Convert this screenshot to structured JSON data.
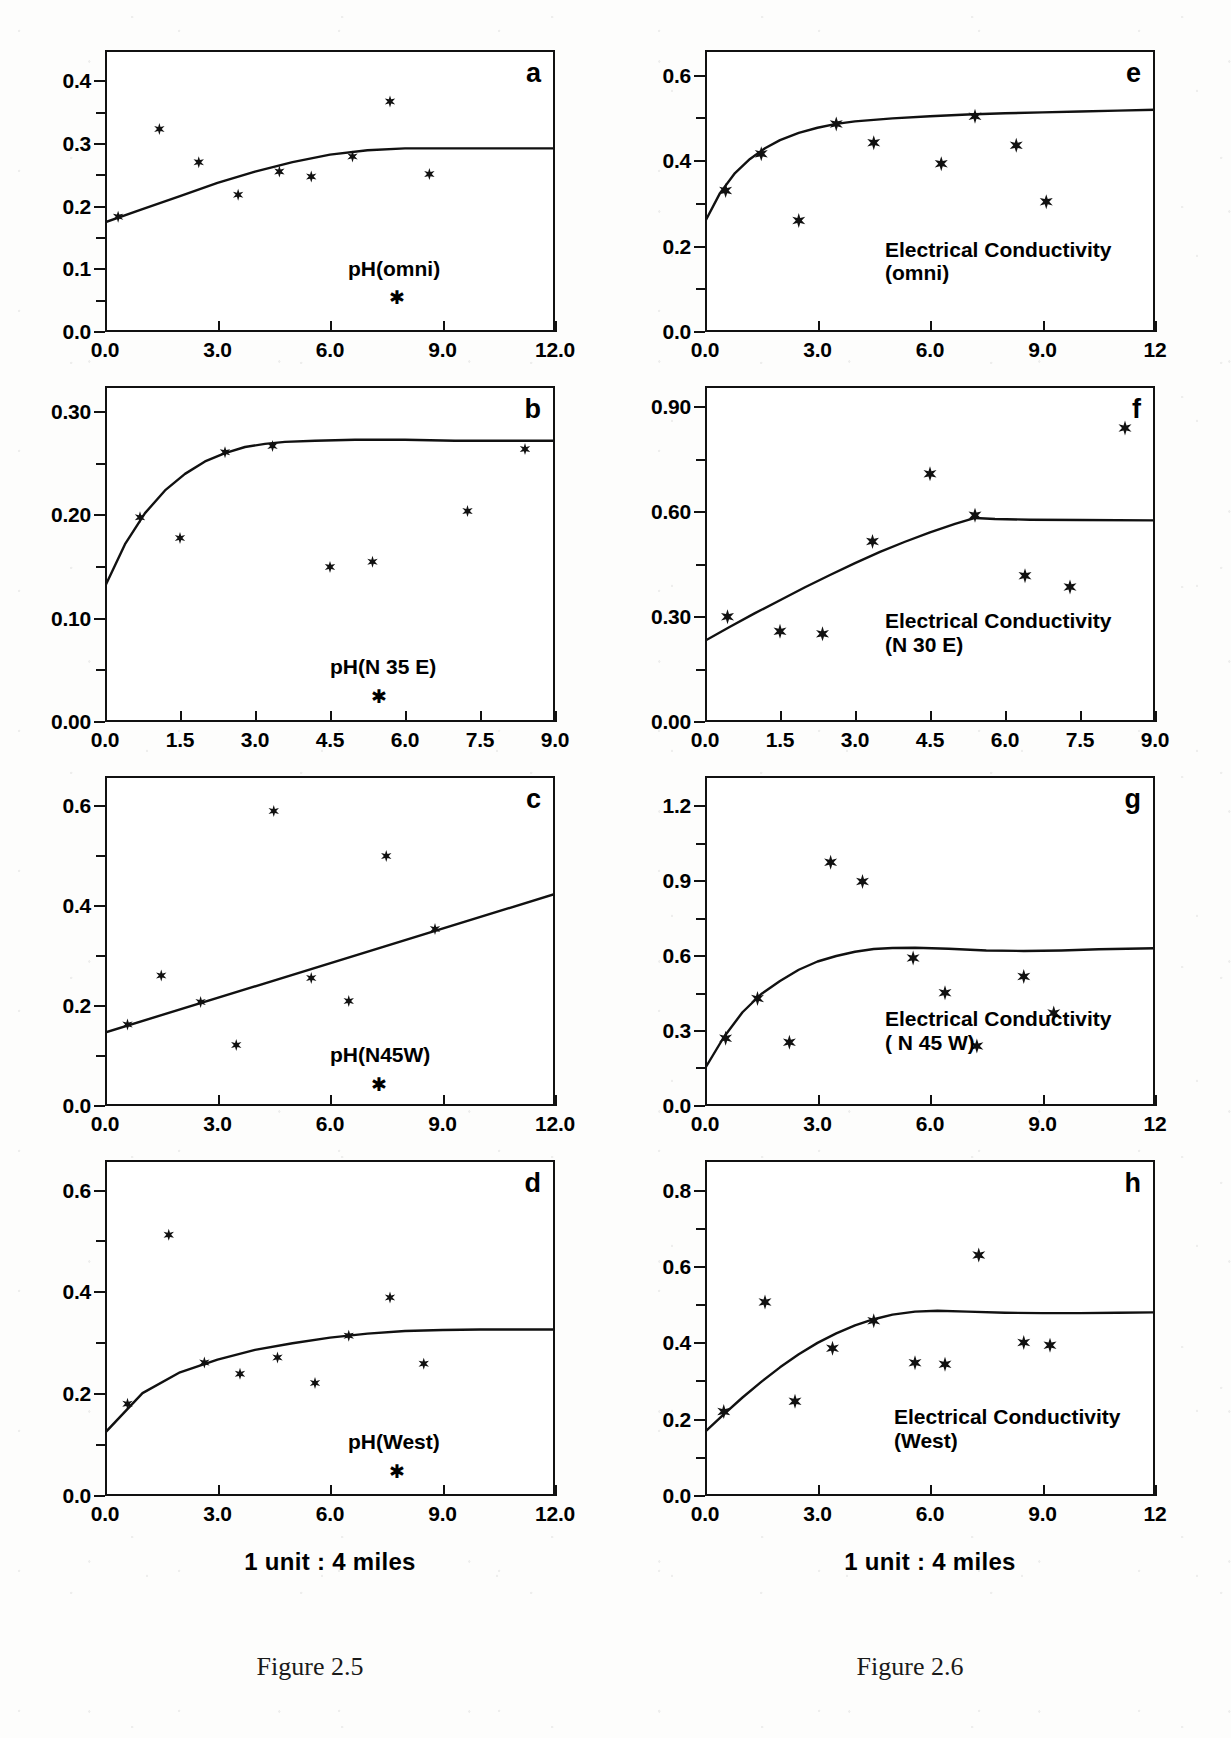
{
  "captions": {
    "left": "Figure 2.5",
    "right": "Figure 2.6"
  },
  "axis_title": "1 unit : 4 miles",
  "chart_data": [
    {
      "type": "scatter",
      "panel": "a",
      "title": "pH(omni)",
      "xlabel": "1 unit : 4 miles",
      "ylabel": "",
      "xlim": [
        0.0,
        12.0
      ],
      "ylim": [
        0.0,
        0.45
      ],
      "xticks": [
        "0.0",
        "3.0",
        "6.0",
        "9.0",
        "12.0"
      ],
      "xtick_values": [
        0.0,
        3.0,
        6.0,
        9.0,
        12.0
      ],
      "yticks": [
        "0.0",
        "0.1",
        "0.2",
        "0.3",
        "0.4"
      ],
      "ytick_values": [
        0.0,
        0.1,
        0.2,
        0.3,
        0.4
      ],
      "grid": false,
      "legend": "none",
      "points": [
        [
          0.35,
          0.184
        ],
        [
          1.45,
          0.324
        ],
        [
          2.5,
          0.271
        ],
        [
          3.55,
          0.219
        ],
        [
          4.65,
          0.256
        ],
        [
          5.5,
          0.248
        ],
        [
          6.6,
          0.28
        ],
        [
          7.6,
          0.368
        ],
        [
          8.65,
          0.252
        ]
      ],
      "model": [
        [
          0.0,
          0.175
        ],
        [
          1.0,
          0.196
        ],
        [
          2.0,
          0.217
        ],
        [
          3.0,
          0.238
        ],
        [
          4.0,
          0.256
        ],
        [
          5.0,
          0.271
        ],
        [
          6.0,
          0.283
        ],
        [
          7.0,
          0.29
        ],
        [
          8.0,
          0.293
        ],
        [
          9.0,
          0.293
        ],
        [
          10.0,
          0.293
        ],
        [
          11.0,
          0.293
        ],
        [
          12.0,
          0.293
        ]
      ]
    },
    {
      "type": "scatter",
      "panel": "b",
      "title": "pH(N 35 E)",
      "xlabel": "1 unit : 4 miles",
      "ylabel": "",
      "xlim": [
        0.0,
        9.0
      ],
      "ylim": [
        0.0,
        0.325
      ],
      "xticks": [
        "0.0",
        "1.5",
        "3.0",
        "4.5",
        "6.0",
        "7.5",
        "9.0"
      ],
      "xtick_values": [
        0.0,
        1.5,
        3.0,
        4.5,
        6.0,
        7.5,
        9.0
      ],
      "yticks": [
        "0.00",
        "0.10",
        "0.20",
        "0.30"
      ],
      "ytick_values": [
        0.0,
        0.1,
        0.2,
        0.3
      ],
      "grid": false,
      "legend": "none",
      "points": [
        [
          0.7,
          0.198
        ],
        [
          1.5,
          0.178
        ],
        [
          2.4,
          0.261
        ],
        [
          3.35,
          0.267
        ],
        [
          4.5,
          0.15
        ],
        [
          5.35,
          0.155
        ],
        [
          7.25,
          0.204
        ],
        [
          8.4,
          0.264
        ]
      ],
      "model": [
        [
          0.0,
          0.131
        ],
        [
          0.4,
          0.172
        ],
        [
          0.8,
          0.202
        ],
        [
          1.2,
          0.224
        ],
        [
          1.6,
          0.24
        ],
        [
          2.0,
          0.252
        ],
        [
          2.4,
          0.26
        ],
        [
          2.8,
          0.266
        ],
        [
          3.2,
          0.269
        ],
        [
          3.6,
          0.271
        ],
        [
          4.2,
          0.272
        ],
        [
          5.0,
          0.273
        ],
        [
          6.0,
          0.273
        ],
        [
          7.0,
          0.272
        ],
        [
          8.0,
          0.272
        ],
        [
          9.0,
          0.272
        ]
      ]
    },
    {
      "type": "scatter",
      "panel": "c",
      "title": "pH(N45W)",
      "xlabel": "1 unit : 4 miles",
      "ylabel": "",
      "xlim": [
        0.0,
        12.0
      ],
      "ylim": [
        0.0,
        0.66
      ],
      "xticks": [
        "0.0",
        "3.0",
        "6.0",
        "9.0",
        "12.0"
      ],
      "xtick_values": [
        0.0,
        3.0,
        6.0,
        9.0,
        12.0
      ],
      "yticks": [
        "0.0",
        "0.2",
        "0.4",
        "0.6"
      ],
      "ytick_values": [
        0.0,
        0.2,
        0.4,
        0.6
      ],
      "grid": false,
      "legend": "none",
      "points": [
        [
          0.6,
          0.163
        ],
        [
          1.5,
          0.261
        ],
        [
          2.55,
          0.208
        ],
        [
          3.5,
          0.122
        ],
        [
          4.5,
          0.59
        ],
        [
          5.5,
          0.256
        ],
        [
          6.5,
          0.21
        ],
        [
          7.5,
          0.5
        ],
        [
          8.8,
          0.354
        ]
      ],
      "model": [
        [
          0.0,
          0.147
        ],
        [
          12.0,
          0.424
        ]
      ]
    },
    {
      "type": "scatter",
      "panel": "d",
      "title": "pH(West)",
      "xlabel": "1 unit : 4 miles",
      "ylabel": "",
      "xlim": [
        0.0,
        12.0
      ],
      "ylim": [
        0.0,
        0.66
      ],
      "xticks": [
        "0.0",
        "3.0",
        "6.0",
        "9.0",
        "12.0"
      ],
      "xtick_values": [
        0.0,
        3.0,
        6.0,
        9.0,
        12.0
      ],
      "yticks": [
        "0.0",
        "0.2",
        "0.4",
        "0.6"
      ],
      "ytick_values": [
        0.0,
        0.2,
        0.4,
        0.6
      ],
      "grid": false,
      "legend": "none",
      "points": [
        [
          0.6,
          0.181
        ],
        [
          1.7,
          0.513
        ],
        [
          2.65,
          0.262
        ],
        [
          3.6,
          0.24
        ],
        [
          4.6,
          0.272
        ],
        [
          5.6,
          0.222
        ],
        [
          6.5,
          0.315
        ],
        [
          7.6,
          0.39
        ],
        [
          8.5,
          0.26
        ]
      ],
      "model": [
        [
          0.0,
          0.124
        ],
        [
          1.0,
          0.202
        ],
        [
          2.0,
          0.243
        ],
        [
          3.0,
          0.268
        ],
        [
          4.0,
          0.287
        ],
        [
          5.0,
          0.3
        ],
        [
          6.0,
          0.311
        ],
        [
          7.0,
          0.319
        ],
        [
          8.0,
          0.324
        ],
        [
          9.0,
          0.326
        ],
        [
          10.0,
          0.327
        ],
        [
          11.0,
          0.327
        ],
        [
          12.0,
          0.327
        ]
      ]
    },
    {
      "type": "scatter",
      "panel": "e",
      "title": "Electrical Conductivity\n(omni)",
      "xlabel": "1 unit : 4 miles",
      "ylabel": "",
      "xlim": [
        0.0,
        12.0
      ],
      "ylim": [
        0.0,
        0.66
      ],
      "xticks": [
        "0.0",
        "3.0",
        "6.0",
        "9.0",
        "12"
      ],
      "xtick_values": [
        0.0,
        3.0,
        6.0,
        9.0,
        12.0
      ],
      "yticks": [
        "0.0",
        "0.2",
        "0.4",
        "0.6"
      ],
      "ytick_values": [
        0.0,
        0.2,
        0.4,
        0.6
      ],
      "grid": false,
      "legend": "none",
      "points": [
        [
          0.55,
          0.331
        ],
        [
          1.5,
          0.417
        ],
        [
          2.5,
          0.261
        ],
        [
          3.5,
          0.487
        ],
        [
          4.5,
          0.443
        ],
        [
          6.3,
          0.394
        ],
        [
          7.2,
          0.505
        ],
        [
          8.3,
          0.437
        ],
        [
          9.1,
          0.305
        ]
      ],
      "model": [
        [
          0.0,
          0.258
        ],
        [
          0.4,
          0.325
        ],
        [
          0.8,
          0.372
        ],
        [
          1.2,
          0.405
        ],
        [
          1.6,
          0.43
        ],
        [
          2.0,
          0.449
        ],
        [
          2.5,
          0.466
        ],
        [
          3.0,
          0.478
        ],
        [
          3.5,
          0.487
        ],
        [
          4.0,
          0.493
        ],
        [
          5.0,
          0.5
        ],
        [
          6.0,
          0.505
        ],
        [
          7.0,
          0.509
        ],
        [
          8.0,
          0.512
        ],
        [
          9.0,
          0.514
        ],
        [
          10.0,
          0.516
        ],
        [
          11.0,
          0.518
        ],
        [
          12.0,
          0.52
        ]
      ]
    },
    {
      "type": "scatter",
      "panel": "f",
      "title": "Electrical Conductivity\n(N 30 E)",
      "xlabel": "1 unit : 4 miles",
      "ylabel": "",
      "xlim": [
        0.0,
        9.0
      ],
      "ylim": [
        0.0,
        0.96
      ],
      "xticks": [
        "0.0",
        "1.5",
        "3.0",
        "4.5",
        "6.0",
        "7.5",
        "9.0"
      ],
      "xtick_values": [
        0.0,
        1.5,
        3.0,
        4.5,
        6.0,
        7.5,
        9.0
      ],
      "yticks": [
        "0.00",
        "0.30",
        "0.60",
        "0.90"
      ],
      "ytick_values": [
        0.0,
        0.3,
        0.6,
        0.9
      ],
      "grid": false,
      "legend": "none",
      "points": [
        [
          0.45,
          0.301
        ],
        [
          1.5,
          0.259
        ],
        [
          2.35,
          0.252
        ],
        [
          3.35,
          0.516
        ],
        [
          4.5,
          0.709
        ],
        [
          5.4,
          0.591
        ],
        [
          6.4,
          0.418
        ],
        [
          7.3,
          0.386
        ],
        [
          8.4,
          0.84
        ]
      ],
      "model": [
        [
          0.0,
          0.232
        ],
        [
          0.5,
          0.272
        ],
        [
          1.0,
          0.311
        ],
        [
          1.5,
          0.348
        ],
        [
          2.0,
          0.385
        ],
        [
          2.5,
          0.42
        ],
        [
          3.0,
          0.454
        ],
        [
          3.5,
          0.486
        ],
        [
          4.0,
          0.515
        ],
        [
          4.5,
          0.542
        ],
        [
          5.0,
          0.566
        ],
        [
          5.4,
          0.583
        ],
        [
          5.8,
          0.58
        ],
        [
          6.5,
          0.578
        ],
        [
          7.5,
          0.577
        ],
        [
          9.0,
          0.576
        ]
      ]
    },
    {
      "type": "scatter",
      "panel": "g",
      "title": "Electrical Conductivity\n( N 45 W)",
      "xlabel": "1 unit : 4 miles",
      "ylabel": "",
      "xlim": [
        0.0,
        12.0
      ],
      "ylim": [
        0.0,
        1.32
      ],
      "xticks": [
        "0.0",
        "3.0",
        "6.0",
        "9.0",
        "12"
      ],
      "xtick_values": [
        0.0,
        3.0,
        6.0,
        9.0,
        12.0
      ],
      "yticks": [
        "0.0",
        "0.3",
        "0.6",
        "0.9",
        "1.2"
      ],
      "ytick_values": [
        0.0,
        0.3,
        0.6,
        0.9,
        1.2
      ],
      "grid": false,
      "legend": "none",
      "points": [
        [
          0.55,
          0.271
        ],
        [
          1.4,
          0.43
        ],
        [
          2.25,
          0.255
        ],
        [
          3.35,
          0.975
        ],
        [
          4.2,
          0.898
        ],
        [
          5.55,
          0.592
        ],
        [
          6.4,
          0.453
        ],
        [
          7.25,
          0.24
        ],
        [
          8.5,
          0.518
        ],
        [
          9.3,
          0.372
        ]
      ],
      "model": [
        [
          0.0,
          0.15
        ],
        [
          0.5,
          0.275
        ],
        [
          1.0,
          0.375
        ],
        [
          1.5,
          0.448
        ],
        [
          2.0,
          0.5
        ],
        [
          2.5,
          0.545
        ],
        [
          3.0,
          0.578
        ],
        [
          3.5,
          0.6
        ],
        [
          4.0,
          0.617
        ],
        [
          4.5,
          0.628
        ],
        [
          5.0,
          0.632
        ],
        [
          5.6,
          0.633
        ],
        [
          6.5,
          0.629
        ],
        [
          7.5,
          0.622
        ],
        [
          8.5,
          0.62
        ],
        [
          9.5,
          0.622
        ],
        [
          10.5,
          0.627
        ],
        [
          12.0,
          0.631
        ]
      ]
    },
    {
      "type": "scatter",
      "panel": "h",
      "title": "Electrical Conductivity\n(West)",
      "xlabel": "1 unit : 4 miles",
      "ylabel": "",
      "xlim": [
        0.0,
        12.0
      ],
      "ylim": [
        0.0,
        0.88
      ],
      "xticks": [
        "0.0",
        "3.0",
        "6.0",
        "9.0",
        "12"
      ],
      "xtick_values": [
        0.0,
        3.0,
        6.0,
        9.0,
        12.0
      ],
      "yticks": [
        "0.0",
        "0.2",
        "0.4",
        "0.6",
        "0.8"
      ],
      "ytick_values": [
        0.0,
        0.2,
        0.4,
        0.6,
        0.8
      ],
      "grid": false,
      "legend": "none",
      "points": [
        [
          0.5,
          0.221
        ],
        [
          1.6,
          0.508
        ],
        [
          2.4,
          0.248
        ],
        [
          3.4,
          0.387
        ],
        [
          4.5,
          0.459
        ],
        [
          5.6,
          0.349
        ],
        [
          6.4,
          0.345
        ],
        [
          7.3,
          0.631
        ],
        [
          8.5,
          0.402
        ],
        [
          9.2,
          0.395
        ]
      ],
      "model": [
        [
          0.0,
          0.168
        ],
        [
          0.5,
          0.214
        ],
        [
          1.0,
          0.258
        ],
        [
          1.5,
          0.299
        ],
        [
          2.0,
          0.337
        ],
        [
          2.5,
          0.371
        ],
        [
          3.0,
          0.401
        ],
        [
          3.5,
          0.426
        ],
        [
          4.0,
          0.447
        ],
        [
          4.5,
          0.463
        ],
        [
          5.0,
          0.475
        ],
        [
          5.6,
          0.483
        ],
        [
          6.2,
          0.485
        ],
        [
          7.0,
          0.483
        ],
        [
          8.0,
          0.48
        ],
        [
          9.0,
          0.479
        ],
        [
          10.0,
          0.479
        ],
        [
          11.0,
          0.48
        ],
        [
          12.0,
          0.481
        ]
      ]
    }
  ]
}
